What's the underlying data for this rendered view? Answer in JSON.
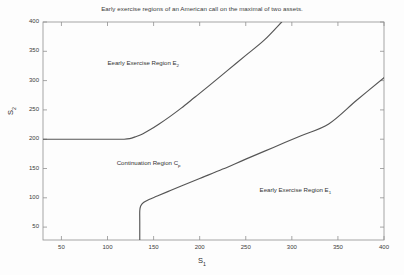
{
  "chart_data": {
    "type": "line",
    "title": "Early exercise regions of an American call on the maximal of two assets.",
    "xlabel": "S",
    "xlabel_sub": "1",
    "ylabel": "S",
    "ylabel_sub": "2",
    "xlim": [
      30,
      400
    ],
    "ylim": [
      28,
      400
    ],
    "xticks": [
      50,
      100,
      150,
      200,
      250,
      300,
      350,
      400
    ],
    "yticks": [
      50,
      100,
      150,
      200,
      250,
      300,
      350,
      400
    ],
    "grid": false,
    "legend": "none",
    "line_color": "#555555",
    "axis_color": "#808080",
    "background": "#fdfdfd",
    "series": [
      {
        "name": "upper-boundary",
        "comment": "Early exercise boundary for asset 2: flat at S2=200 then rising",
        "points": [
          [
            30,
            200
          ],
          [
            60,
            200
          ],
          [
            90,
            200
          ],
          [
            110,
            200
          ],
          [
            118,
            200
          ],
          [
            124,
            201
          ],
          [
            130,
            204
          ],
          [
            138,
            209
          ],
          [
            146,
            216
          ],
          [
            156,
            226
          ],
          [
            168,
            239
          ],
          [
            180,
            253
          ],
          [
            195,
            272
          ],
          [
            210,
            291
          ],
          [
            230,
            317
          ],
          [
            250,
            343
          ],
          [
            270,
            369
          ],
          [
            289,
            400
          ]
        ]
      },
      {
        "name": "lower-boundary",
        "comment": "Early exercise boundary for asset 1: vertical at S1=135 then rising",
        "points": [
          [
            135,
            28
          ],
          [
            135,
            60
          ],
          [
            135,
            78
          ],
          [
            136,
            86
          ],
          [
            139,
            92
          ],
          [
            145,
            97
          ],
          [
            154,
            103
          ],
          [
            166,
            111
          ],
          [
            180,
            120
          ],
          [
            200,
            133
          ],
          [
            225,
            149
          ],
          [
            250,
            166
          ],
          [
            280,
            186
          ],
          [
            310,
            206
          ],
          [
            340,
            226
          ],
          [
            370,
            266
          ],
          [
            400,
            305
          ]
        ]
      }
    ],
    "annotations": [
      {
        "id": "upper-region",
        "text": "Eearly Exercise Region E",
        "sub": "2",
        "x": 100,
        "y": 330
      },
      {
        "id": "continuation-region",
        "text": "Continuation Region C",
        "sub": "p",
        "x": 110,
        "y": 160
      },
      {
        "id": "lower-region",
        "text": "Eearly Exercise Region E",
        "sub": "1",
        "x": 265,
        "y": 113
      }
    ]
  }
}
